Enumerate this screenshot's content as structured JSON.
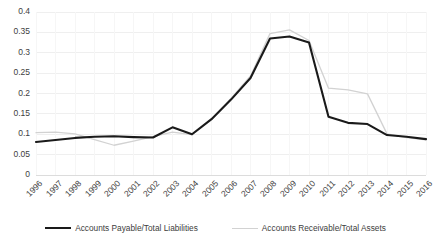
{
  "chart_data": {
    "type": "line",
    "title": "",
    "xlabel": "",
    "ylabel": "",
    "grid": true,
    "legend_position": "bottom",
    "ylim": [
      0,
      0.4
    ],
    "yticks": [
      "0",
      "0.05",
      "0.1",
      "0.15",
      "0.2",
      "0.25",
      "0.3",
      "0.35",
      "0.4"
    ],
    "ytick_values": [
      0,
      0.05,
      0.1,
      0.15,
      0.2,
      0.25,
      0.3,
      0.35,
      0.4
    ],
    "categories": [
      "1996",
      "1997",
      "1998",
      "1999",
      "2000",
      "2001",
      "2002",
      "2003",
      "2004",
      "2005",
      "2006",
      "2007",
      "2008",
      "2009",
      "2010",
      "2011",
      "2012",
      "2013",
      "2014",
      "2015",
      "2016"
    ],
    "series": [
      {
        "name": "Accounts Payable/Total Liabilities",
        "color": "#1a1a1a",
        "values": [
          0.081,
          0.086,
          0.091,
          0.094,
          0.095,
          0.093,
          0.092,
          0.117,
          0.1,
          0.137,
          0.185,
          0.238,
          0.335,
          0.34,
          0.325,
          0.143,
          0.128,
          0.125,
          0.098,
          0.094,
          0.088
        ]
      },
      {
        "name": "Accounts Receivable/Total Assets",
        "color": "#d2d2d2",
        "values": [
          0.104,
          0.105,
          0.101,
          0.087,
          0.073,
          0.083,
          0.094,
          0.105,
          0.099,
          0.136,
          0.188,
          0.243,
          0.347,
          0.356,
          0.33,
          0.213,
          0.209,
          0.199,
          0.101,
          0.092,
          0.086
        ]
      }
    ]
  },
  "legend": {
    "entries": [
      {
        "label": "Accounts Payable/Total Liabilities"
      },
      {
        "label": "Accounts Receivable/Total Assets"
      }
    ]
  }
}
